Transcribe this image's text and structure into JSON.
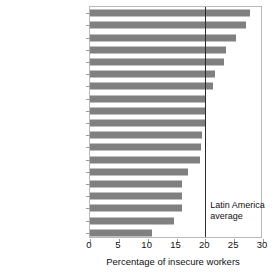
{
  "chart_data": {
    "type": "bar",
    "orientation": "horizontal",
    "title": "",
    "subtitle": "",
    "xlabel": "Percentage of insecure workers",
    "ylabel": "",
    "xlim": [
      0,
      30
    ],
    "xticks": [
      0,
      5,
      10,
      15,
      20,
      25,
      30
    ],
    "xticklabels": [
      "0",
      "5",
      "10",
      "15",
      "20",
      "25",
      "30"
    ],
    "grid": false,
    "legend": null,
    "bar_color": "#808080",
    "categories": [
      "Mexico",
      "Belize",
      "Bolivia",
      "Peru",
      "El Salvador",
      "Honduras",
      "Chile",
      "Dominican Republic",
      "Ecuador",
      "Colombia",
      "Brazil",
      "Argentina",
      "Guyana",
      "Guatemala",
      "Panama",
      "Nicaragua",
      "Costa Rica",
      "Uruguay",
      "Paraguay"
    ],
    "values": [
      27.8,
      27.0,
      25.3,
      23.5,
      23.3,
      21.7,
      21.3,
      20.2,
      20.0,
      20.0,
      19.4,
      19.3,
      19.0,
      17.0,
      16.0,
      16.0,
      16.0,
      14.5,
      10.7
    ],
    "annotations": [
      {
        "name": "latin-america-average",
        "line_value": 20,
        "label_line1": "Latin America",
        "label_line2": "average"
      }
    ]
  }
}
